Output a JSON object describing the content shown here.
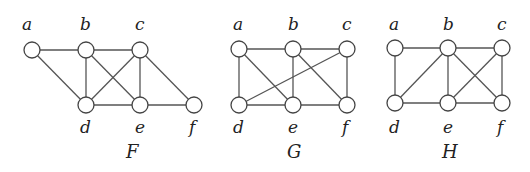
{
  "graphs": [
    {
      "name": "F",
      "name_pos": [
        126,
        158
      ],
      "nodes": [
        {
          "id": "a",
          "x": 32,
          "y": 50,
          "lx": 22,
          "ly": 30
        },
        {
          "id": "b",
          "x": 86,
          "y": 50,
          "lx": 80,
          "ly": 30
        },
        {
          "id": "c",
          "x": 140,
          "y": 50,
          "lx": 135,
          "ly": 30
        },
        {
          "id": "d",
          "x": 86,
          "y": 105,
          "lx": 80,
          "ly": 133
        },
        {
          "id": "e",
          "x": 140,
          "y": 105,
          "lx": 135,
          "ly": 133
        },
        {
          "id": "f",
          "x": 194,
          "y": 105,
          "lx": 189,
          "ly": 133
        }
      ],
      "edges": [
        [
          "a",
          "b"
        ],
        [
          "a",
          "d"
        ],
        [
          "b",
          "c"
        ],
        [
          "b",
          "d"
        ],
        [
          "b",
          "e"
        ],
        [
          "c",
          "d"
        ],
        [
          "c",
          "e"
        ],
        [
          "c",
          "f"
        ],
        [
          "d",
          "e"
        ],
        [
          "e",
          "f"
        ]
      ]
    },
    {
      "name": "G",
      "name_pos": [
        287,
        158
      ],
      "nodes": [
        {
          "id": "a",
          "x": 239,
          "y": 49,
          "lx": 233,
          "ly": 30
        },
        {
          "id": "b",
          "x": 293,
          "y": 49,
          "lx": 288,
          "ly": 30
        },
        {
          "id": "c",
          "x": 347,
          "y": 49,
          "lx": 342,
          "ly": 30
        },
        {
          "id": "d",
          "x": 239,
          "y": 105,
          "lx": 233,
          "ly": 133
        },
        {
          "id": "e",
          "x": 293,
          "y": 105,
          "lx": 288,
          "ly": 133
        },
        {
          "id": "f",
          "x": 347,
          "y": 105,
          "lx": 342,
          "ly": 133
        }
      ],
      "edges": [
        [
          "a",
          "b"
        ],
        [
          "b",
          "c"
        ],
        [
          "a",
          "d"
        ],
        [
          "a",
          "e"
        ],
        [
          "b",
          "e"
        ],
        [
          "b",
          "f"
        ],
        [
          "c",
          "d"
        ],
        [
          "c",
          "f"
        ],
        [
          "d",
          "e"
        ],
        [
          "e",
          "f"
        ]
      ]
    },
    {
      "name": "H",
      "name_pos": [
        442,
        158
      ],
      "nodes": [
        {
          "id": "a",
          "x": 395,
          "y": 48,
          "lx": 389,
          "ly": 30
        },
        {
          "id": "b",
          "x": 448,
          "y": 48,
          "lx": 443,
          "ly": 30
        },
        {
          "id": "c",
          "x": 502,
          "y": 48,
          "lx": 497,
          "ly": 30
        },
        {
          "id": "d",
          "x": 395,
          "y": 103,
          "lx": 389,
          "ly": 133
        },
        {
          "id": "e",
          "x": 448,
          "y": 103,
          "lx": 443,
          "ly": 133
        },
        {
          "id": "f",
          "x": 502,
          "y": 103,
          "lx": 497,
          "ly": 133
        }
      ],
      "edges": [
        [
          "a",
          "b"
        ],
        [
          "b",
          "c"
        ],
        [
          "a",
          "d"
        ],
        [
          "b",
          "d"
        ],
        [
          "b",
          "e"
        ],
        [
          "b",
          "f"
        ],
        [
          "c",
          "e"
        ],
        [
          "c",
          "f"
        ],
        [
          "d",
          "e"
        ],
        [
          "e",
          "f"
        ]
      ]
    }
  ],
  "style": {
    "node_radius": 8
  }
}
